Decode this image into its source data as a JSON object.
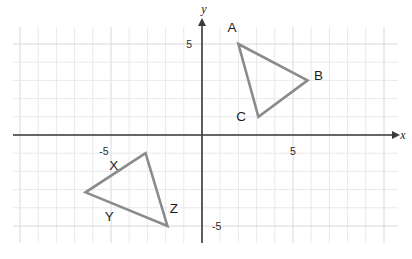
{
  "chart_data": {
    "type": "scatter",
    "title": "",
    "xlabel": "x",
    "ylabel": "y",
    "xlim": [
      -10.4,
      10.8
    ],
    "ylim": [
      -5.9,
      5.9
    ],
    "grid": true,
    "grid_step": 1,
    "legend": "none",
    "x_tick_labels": [
      {
        "value": -5,
        "text": "-5"
      },
      {
        "value": 5,
        "text": "5"
      }
    ],
    "y_tick_labels": [
      {
        "value": 5,
        "text": "5"
      },
      {
        "value": -5,
        "text": "-5"
      }
    ],
    "axis_labels": {
      "x": "x",
      "y": "y"
    },
    "shapes": [
      {
        "name": "triangle-abc",
        "type": "polygon",
        "stroke": "#8b8b8b",
        "fill": "none",
        "vertices": [
          {
            "label": "A",
            "x": 2,
            "y": 5
          },
          {
            "label": "B",
            "x": 5.8,
            "y": 3
          },
          {
            "label": "C",
            "x": 3.1,
            "y": 1
          }
        ],
        "vertex_label_offsets": [
          {
            "label": "A",
            "dx": -0.35,
            "dy": 0.95
          },
          {
            "label": "B",
            "dx": 0.6,
            "dy": 0.3
          },
          {
            "label": "C",
            "dx": -0.95,
            "dy": 0.05
          }
        ]
      },
      {
        "name": "triangle-xyz",
        "type": "polygon",
        "stroke": "#8b8b8b",
        "fill": "none",
        "vertices": [
          {
            "label": "X",
            "x": -3.1,
            "y": -1
          },
          {
            "label": "Y",
            "x": -6.4,
            "y": -3.15
          },
          {
            "label": "Z",
            "x": -1.9,
            "y": -5
          }
        ],
        "vertex_label_offsets": [
          {
            "label": "X",
            "dx": -1.75,
            "dy": -0.65
          },
          {
            "label": "Y",
            "dx": 1.3,
            "dy": -1.3
          },
          {
            "label": "Z",
            "dx": 0.35,
            "dy": 1.0
          }
        ]
      }
    ]
  },
  "labels": {
    "vertex_a": "A",
    "vertex_b": "B",
    "vertex_c": "C",
    "vertex_x": "X",
    "vertex_y": "Y",
    "vertex_z": "Z",
    "x_axis": "x",
    "y_axis": "y",
    "tick_x_neg5": "-5",
    "tick_x_pos5": "5",
    "tick_y_pos5": "5",
    "tick_y_neg5": "-5"
  },
  "colors": {
    "background": "#ffffff",
    "grid_minor": "#e9e9ec",
    "grid_major": "#d8d8dd",
    "axis": "#3a3a3a",
    "shape_stroke": "#8b8b8b",
    "text": "#1d1d1d"
  }
}
